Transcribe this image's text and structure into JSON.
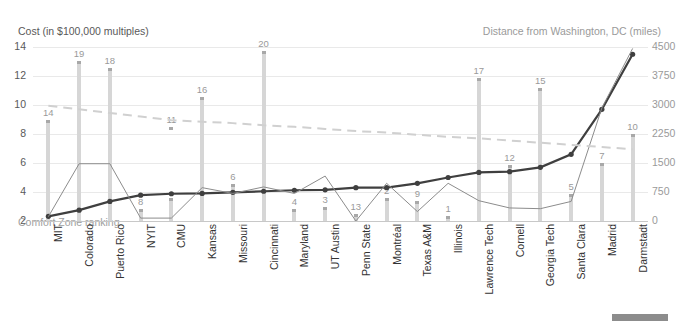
{
  "chart_data": {
    "type": "bar",
    "title": "",
    "left_axis_title": "Cost (in $100,000 multiples)",
    "right_axis_title": "Distance from Washington, DC (miles)",
    "xlabel": "",
    "ylim_left": [
      2,
      14
    ],
    "ylim_right": [
      0,
      4500
    ],
    "yticks_left": [
      "14",
      "12",
      "10",
      "8",
      "6",
      "4",
      "2"
    ],
    "yticks_right": [
      "4500",
      "3750",
      "3000",
      "2250",
      "1500",
      "750",
      "0"
    ],
    "grid": true,
    "legend_position": "inline",
    "categories": [
      "MIT",
      "Colorado",
      "Puerto Rico",
      "NYIT",
      "CMU",
      "Kansas",
      "Missouri",
      "Cincinnati",
      "Maryland",
      "UT Austin",
      "Penn State",
      "Montréal",
      "Texas A&M",
      "Illinois",
      "Lawrence Tech",
      "Cornell",
      "Georgia Tech",
      "Santa Clara",
      "Madrid",
      "Darmstadt"
    ],
    "bar_series": {
      "name": "Distance from Washington, DC (miles)",
      "axis": "right",
      "color": "#d6d6d6",
      "values": [
        2600,
        4150,
        3950,
        300,
        600,
        3200,
        950,
        4400,
        300,
        350,
        175,
        600,
        525,
        125,
        3700,
        1450,
        3450,
        700,
        1500,
        2250
      ],
      "data_labels": [
        "14",
        "19",
        "18",
        "8",
        "",
        "16",
        "6",
        "20",
        "4",
        "3",
        "13",
        "2",
        "9",
        "1",
        "17",
        "12",
        "15",
        "5",
        "7",
        "10"
      ],
      "extra_labels": {
        "CMU": "11"
      }
    },
    "line_series": [
      {
        "name": "Comfort Zone ranking",
        "axis": "left",
        "color": "#3f3f3f",
        "width": 2.2,
        "markers": true,
        "values": [
          2.32,
          2.75,
          3.35,
          3.78,
          3.88,
          3.9,
          3.98,
          4.05,
          4.12,
          4.15,
          4.3,
          4.3,
          4.6,
          5.0,
          5.35,
          5.4,
          5.7,
          6.6,
          9.7,
          13.5
        ]
      },
      {
        "name": "secondary-series",
        "axis": "left",
        "color": "#8c8c8c",
        "width": 1,
        "markers": false,
        "values": [
          2.3,
          5.95,
          5.95,
          2.2,
          2.2,
          4.3,
          3.9,
          4.35,
          3.9,
          5.1,
          2.0,
          4.6,
          2.65,
          4.6,
          3.4,
          2.9,
          2.85,
          3.35,
          9.8,
          13.9
        ]
      },
      {
        "name": "trendline",
        "axis": "left",
        "color": "#d0d0d0",
        "width": 2,
        "dashed": true,
        "markers": false,
        "values": [
          9.95,
          9.7,
          9.45,
          9.2,
          8.95,
          8.85,
          8.75,
          8.6,
          8.5,
          8.35,
          8.2,
          8.1,
          7.95,
          7.8,
          7.7,
          7.55,
          7.4,
          7.25,
          7.1,
          6.95
        ]
      }
    ]
  }
}
